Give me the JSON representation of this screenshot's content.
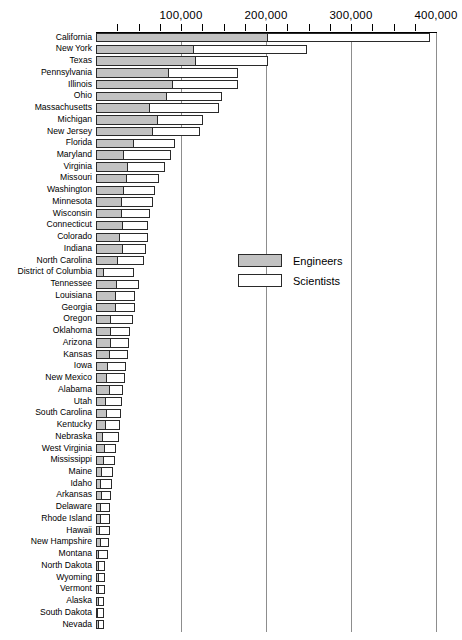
{
  "chart_data": {
    "type": "bar",
    "orientation": "horizontal",
    "stacked": true,
    "title": "",
    "subtitle": "",
    "xlabel": "",
    "ylabel": "",
    "xlim": [
      0,
      400000
    ],
    "x_major_ticks": [
      0,
      100000,
      200000,
      300000,
      400000
    ],
    "x_minor_tick_interval": 25000,
    "x_tick_labels": [
      "100,000",
      "200,000",
      "300,000",
      "400,000"
    ],
    "grid": true,
    "grid_axis": "x",
    "legend_position": "center-right-inside",
    "legend": [
      "Engineers",
      "Scientists"
    ],
    "colors": {
      "engineers": "#c2c2c2",
      "scientists": "#ffffff",
      "outline": "#2a2a2a",
      "gridline": "#8d8d8d",
      "text": "#000000",
      "background": "#ffffff"
    },
    "categories": [
      "California",
      "New York",
      "Texas",
      "Pennsylvania",
      "Illinois",
      "Ohio",
      "Massachusetts",
      "Michigan",
      "New Jersey",
      "Florida",
      "Maryland",
      "Virginia",
      "Missouri",
      "Washington",
      "Minnesota",
      "Wisconsin",
      "Connecticut",
      "Colorado",
      "Indiana",
      "North Carolina",
      "District of Columbia",
      "Tennessee",
      "Louisiana",
      "Georgia",
      "Oregon",
      "Oklahoma",
      "Arizona",
      "Kansas",
      "Iowa",
      "New Mexico",
      "Alabama",
      "Utah",
      "South Carolina",
      "Kentucky",
      "Nebraska",
      "West Virginia",
      "Mississippi",
      "Maine",
      "Idaho",
      "Arkansas",
      "Delaware",
      "Rhode Island",
      "Hawaii",
      "New Hampshire",
      "Montana",
      "North Dakota",
      "Wyoming",
      "Vermont",
      "Alaska",
      "South Dakota",
      "Nevada"
    ],
    "series": [
      {
        "name": "Engineers",
        "values": [
          202000,
          115000,
          118000,
          86000,
          90000,
          83000,
          64000,
          73000,
          67000,
          45000,
          33000,
          38000,
          36000,
          33000,
          31000,
          31000,
          32000,
          28000,
          32000,
          26000,
          9000,
          25000,
          24000,
          24000,
          18000,
          18000,
          18000,
          16000,
          14000,
          13000,
          16000,
          12000,
          13000,
          12000,
          8000,
          10000,
          9000,
          7000,
          6000,
          7000,
          6000,
          6000,
          5000,
          6000,
          4000,
          3000,
          3000,
          3000,
          3000,
          2000,
          3000
        ]
      },
      {
        "name": "Scientists",
        "values": [
          191000,
          133000,
          84000,
          81000,
          77000,
          65000,
          81000,
          53000,
          55000,
          48000,
          55000,
          43000,
          38000,
          37000,
          36000,
          32000,
          29000,
          33000,
          27000,
          30000,
          36000,
          25000,
          22000,
          22000,
          26000,
          22000,
          21000,
          22000,
          21000,
          21000,
          16000,
          19000,
          16000,
          16000,
          19000,
          13000,
          13000,
          13000,
          13000,
          11000,
          11000,
          11000,
          11000,
          9000,
          10000,
          8000,
          8000,
          8000,
          7000,
          7000,
          6000
        ]
      }
    ],
    "totals": [
      393000,
      248000,
      202000,
      167000,
      167000,
      148000,
      145000,
      126000,
      122000,
      93000,
      88000,
      81000,
      74000,
      70000,
      67000,
      63000,
      61000,
      61000,
      59000,
      56000,
      45000,
      50000,
      46000,
      46000,
      44000,
      40000,
      39000,
      38000,
      35000,
      34000,
      32000,
      31000,
      29000,
      28000,
      27000,
      23000,
      22000,
      20000,
      19000,
      18000,
      17000,
      17000,
      16000,
      15000,
      14000,
      11000,
      11000,
      11000,
      10000,
      9000,
      9000
    ]
  }
}
